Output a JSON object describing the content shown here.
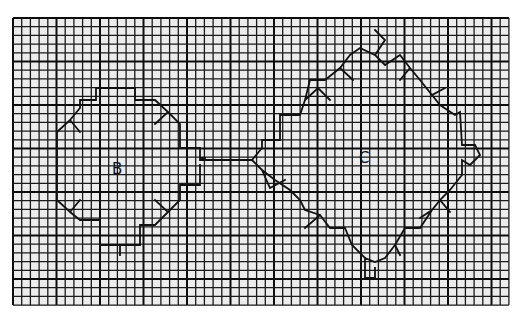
{
  "figure": {
    "background_color": "#ffffff",
    "paper_color": "#ececec",
    "line_color": "#1a1a1a",
    "grid": {
      "x0": 13,
      "y0": 18,
      "cell": 8.7,
      "cols": 57,
      "rows": 33,
      "heavy_every": 5
    }
  },
  "labels": {
    "b": {
      "text": "B",
      "x": 112,
      "y": 174
    },
    "c": {
      "text": "C",
      "x": 359,
      "y": 163
    }
  },
  "shapes": {
    "b_outline": "M 57,150 L 57,132 L 70,120 L 80,132 M 70,120 L 80,108 L 80,100 L 96,100 L 96,88 L 135,88 L 135,100 L 155,100 L 168,112 L 155,124 M 168,112 L 180,124 L 180,148 L 200,148 L 200,158 L 205,158 M 57,150 L 57,200 L 70,212 L 80,200 M 70,212 L 80,220 L 100,220 L 100,245 L 120,245 L 120,255 M 100,245 L 140,245 L 140,225 L 155,225 L 168,212 L 180,200 L 180,185 L 200,185 L 200,165 M 168,212 L 155,200",
    "connector": "M 200,160 L 252,160",
    "c_outline": "M 252,160 L 262,148 L 262,140 L 280,140 L 280,115 L 300,115 L 305,100 L 318,88 L 330,100 M 305,100 L 310,80 L 325,80 L 340,68 L 350,55 M 340,68 L 353,80 M 350,55 L 360,48 L 375,55 L 385,40 L 375,30 M 375,55 L 385,65 L 400,55 L 410,68 L 420,80 M 410,68 L 400,80 M 420,80 L 432,95 L 445,88 M 432,95 L 440,105 L 455,115 L 460,112 L 462,145 L 475,145 L 480,155 L 470,165 L 462,160 L 462,175 L 450,190 L 440,200 L 432,210 L 420,218 M 440,200 L 450,212 M 432,210 L 420,228 L 405,228 L 395,245 L 385,258 L 375,262 L 365,258 L 352,245 L 345,228 M 395,245 L 400,255 M 365,258 L 365,278 L 375,278 L 375,268 M 345,228 L 330,228 L 320,215 L 305,210 L 300,200 L 290,190 L 275,180 L 262,170 L 252,160 M 320,215 L 305,228 M 262,170 L 270,188 L 285,180"
  }
}
